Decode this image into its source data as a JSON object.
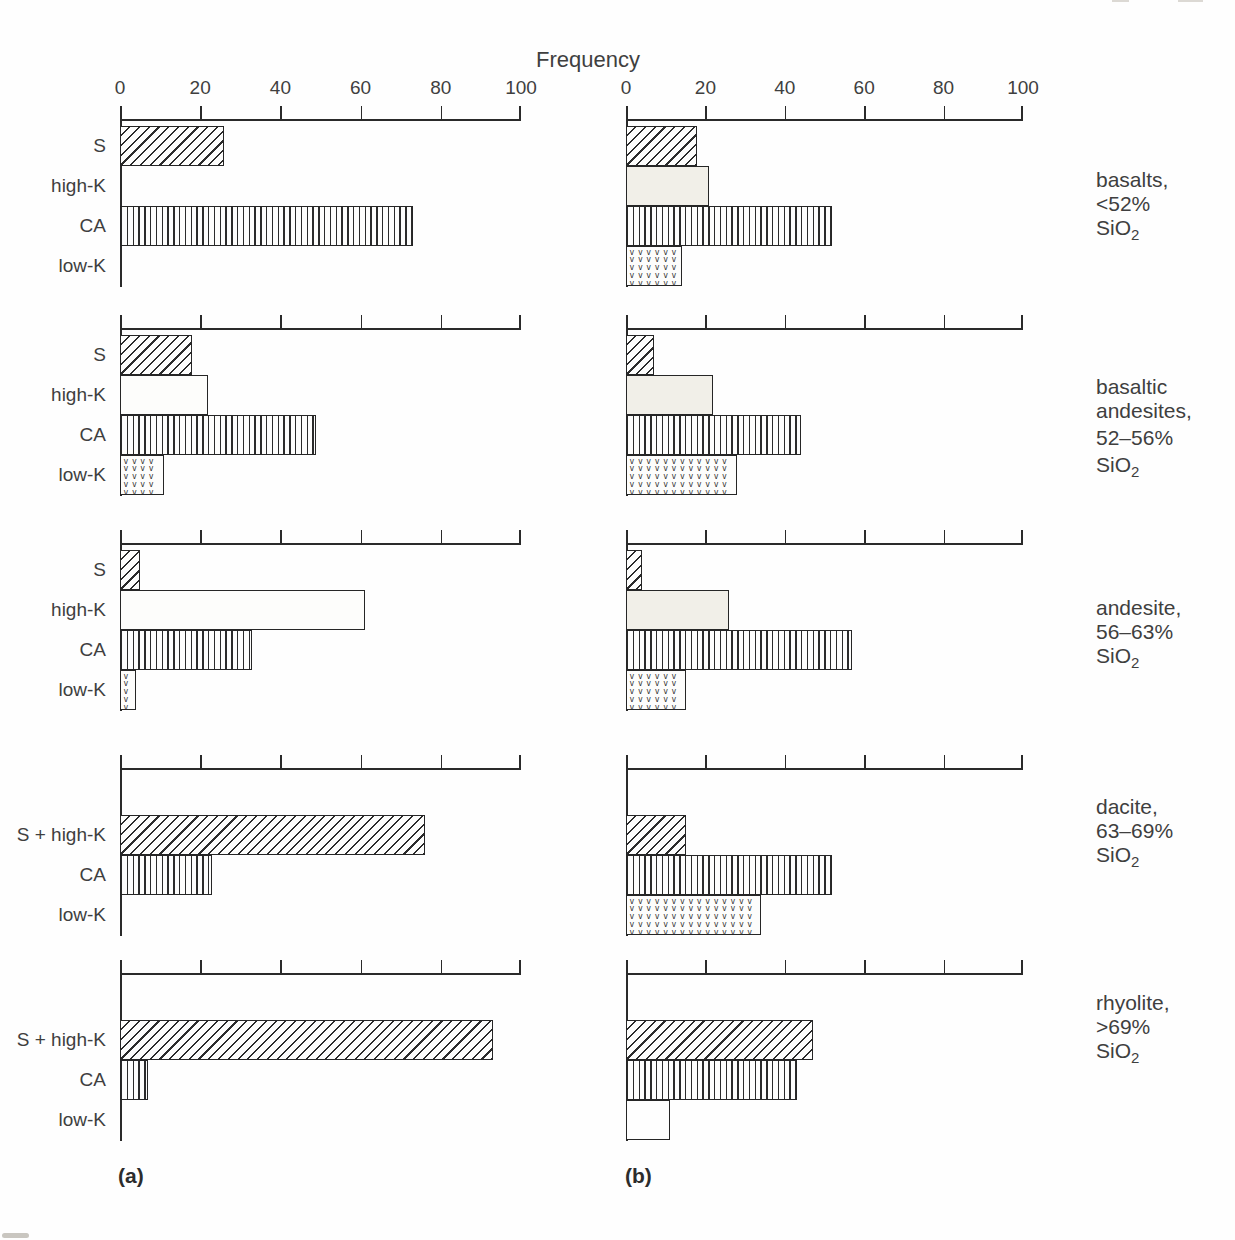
{
  "figure": {
    "title": "Frequency",
    "axis": {
      "min": 0,
      "max": 100,
      "tick_labels": [
        "0",
        "20",
        "40",
        "60",
        "80",
        "100"
      ]
    },
    "panel_a_label": "(a)",
    "panel_b_label": "(b)",
    "series_legend": [
      {
        "name": "S",
        "pattern": "diagonal-hatch"
      },
      {
        "name": "high-K",
        "pattern": "plain"
      },
      {
        "name": "CA",
        "pattern": "vertical-lines"
      },
      {
        "name": "low-K",
        "pattern": "v-stipple"
      }
    ],
    "row_captions": [
      {
        "lines": [
          "basalts,",
          "<52%"
        ],
        "formula_base": "SiO",
        "formula_sub": "2"
      },
      {
        "lines": [
          "basaltic",
          "andesites,",
          "52–56%"
        ],
        "formula_base": "SiO",
        "formula_sub": "2"
      },
      {
        "lines": [
          "andesite,",
          "56–63%"
        ],
        "formula_base": "SiO",
        "formula_sub": "2"
      },
      {
        "lines": [
          "dacite,",
          "63–69%"
        ],
        "formula_base": "SiO",
        "formula_sub": "2"
      },
      {
        "lines": [
          "rhyolite,",
          ">69%"
        ],
        "formula_base": "SiO",
        "formula_sub": "2"
      }
    ]
  },
  "chart_data": {
    "type": "bar",
    "orientation": "horizontal",
    "title": "Frequency",
    "xlabel": "Frequency",
    "xlim": [
      0,
      100
    ],
    "xticks": [
      0,
      20,
      40,
      60,
      80,
      100
    ],
    "grid": false,
    "panels": [
      {
        "label": "(a)",
        "rows": [
          {
            "rock": "basalts, <52% SiO2",
            "bars": [
              {
                "series": "S",
                "value": 26
              },
              {
                "series": "high-K",
                "value": 0
              },
              {
                "series": "CA",
                "value": 73
              },
              {
                "series": "low-K",
                "value": 0
              }
            ]
          },
          {
            "rock": "basaltic andesites, 52–56% SiO2",
            "bars": [
              {
                "series": "S",
                "value": 18
              },
              {
                "series": "high-K",
                "value": 22
              },
              {
                "series": "CA",
                "value": 49
              },
              {
                "series": "low-K",
                "value": 11
              }
            ]
          },
          {
            "rock": "andesite, 56–63% SiO2",
            "bars": [
              {
                "series": "S",
                "value": 5
              },
              {
                "series": "high-K",
                "value": 61
              },
              {
                "series": "CA",
                "value": 33
              },
              {
                "series": "low-K",
                "value": 4
              }
            ]
          },
          {
            "rock": "dacite, 63–69% SiO2",
            "bars": [
              {
                "series": "S + high-K",
                "value": 76
              },
              {
                "series": "CA",
                "value": 23
              },
              {
                "series": "low-K",
                "value": 0
              }
            ]
          },
          {
            "rock": "rhyolite, >69% SiO2",
            "bars": [
              {
                "series": "S + high-K",
                "value": 93
              },
              {
                "series": "CA",
                "value": 7
              },
              {
                "series": "low-K",
                "value": 0
              }
            ]
          }
        ]
      },
      {
        "label": "(b)",
        "rows": [
          {
            "rock": "basalts, <52% SiO2",
            "bars": [
              {
                "series": "S",
                "value": 18
              },
              {
                "series": "high-K",
                "value": 21
              },
              {
                "series": "CA",
                "value": 52
              },
              {
                "series": "low-K",
                "value": 14
              }
            ]
          },
          {
            "rock": "basaltic andesites, 52–56% SiO2",
            "bars": [
              {
                "series": "S",
                "value": 7
              },
              {
                "series": "high-K",
                "value": 22
              },
              {
                "series": "CA",
                "value": 44
              },
              {
                "series": "low-K",
                "value": 28
              }
            ]
          },
          {
            "rock": "andesite, 56–63% SiO2",
            "bars": [
              {
                "series": "S",
                "value": 4
              },
              {
                "series": "high-K",
                "value": 26
              },
              {
                "series": "CA",
                "value": 57
              },
              {
                "series": "low-K",
                "value": 15
              }
            ]
          },
          {
            "rock": "dacite, 63–69% SiO2",
            "bars": [
              {
                "series": "S + high-K",
                "value": 15
              },
              {
                "series": "CA",
                "value": 52
              },
              {
                "series": "low-K",
                "value": 34
              }
            ]
          },
          {
            "rock": "rhyolite, >69% SiO2",
            "bars": [
              {
                "series": "S + high-K",
                "value": 47
              },
              {
                "series": "CA",
                "value": 43
              },
              {
                "series": "low-K",
                "value": 11,
                "pattern_override": "plain"
              }
            ]
          }
        ]
      }
    ],
    "colors": {
      "ink": "#2a2a2a",
      "high_k_fill_panel_b": "#f1efe8",
      "background": "#fefefe"
    }
  }
}
